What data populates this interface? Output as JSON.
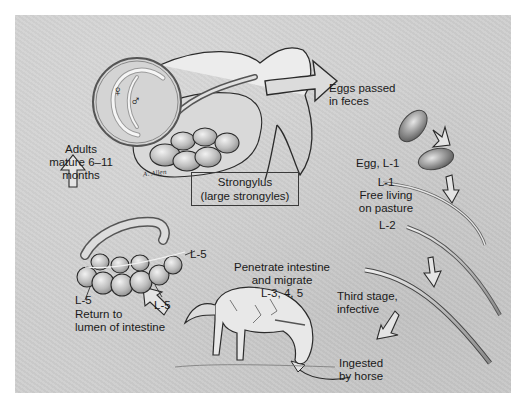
{
  "figure": {
    "title_box": {
      "line1": "Strongylus",
      "line2": "(large strongyles)"
    },
    "signature": "A. Allen",
    "symbols": {
      "female": "♀",
      "male": "♂"
    },
    "stages": [
      {
        "id": "eggs",
        "lines": [
          "Eggs passed",
          "in feces"
        ]
      },
      {
        "id": "egg-l1",
        "lines": [
          "Egg, L-1"
        ]
      },
      {
        "id": "l1-free",
        "lines": [
          "L-1",
          "Free living",
          "on pasture"
        ]
      },
      {
        "id": "l2",
        "lines": [
          "L-2"
        ]
      },
      {
        "id": "l3",
        "lines": [
          "Third stage,",
          "infective"
        ]
      },
      {
        "id": "ingested",
        "lines": [
          "Ingested",
          "by horse"
        ]
      },
      {
        "id": "migrate",
        "lines": [
          "Penetrate intestine",
          "and migrate",
          "L-3, 4, 5"
        ]
      },
      {
        "id": "return",
        "lines": [
          "Return to",
          "lumen of intestine"
        ]
      },
      {
        "id": "adults",
        "lines": [
          "Adults",
          "mature 6–11",
          "months"
        ]
      }
    ],
    "intestine_labels": [
      "L-5",
      "L-5",
      "L-5"
    ],
    "colors": {
      "background": "#cfcfcf",
      "ink": "#1a1a1a",
      "page": "#ffffff"
    }
  }
}
